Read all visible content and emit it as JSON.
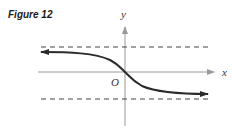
{
  "figure": {
    "label": "Figure 12",
    "x_axis_label": "x",
    "y_axis_label": "y",
    "origin_label": "O",
    "colors": {
      "axis": "#9a9a9a",
      "curve": "#2b2b2b",
      "asymptote": "#444444"
    },
    "elements": {
      "upper_asymptote": "horizontal dashed line (y = c)",
      "lower_asymptote": "horizontal dashed line (y = -c)",
      "curve": "decreasing S-shaped curve through origin approaching asymptotes, arrows at both ends"
    }
  }
}
